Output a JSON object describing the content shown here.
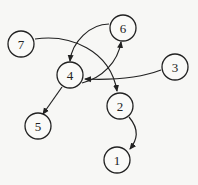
{
  "diagram": {
    "type": "directed-graph",
    "nodes": [
      {
        "id": "1",
        "label": "1",
        "x": 117,
        "y": 160
      },
      {
        "id": "2",
        "label": "2",
        "x": 120,
        "y": 106
      },
      {
        "id": "3",
        "label": "3",
        "x": 175,
        "y": 67
      },
      {
        "id": "4",
        "label": "4",
        "x": 70,
        "y": 75
      },
      {
        "id": "5",
        "label": "5",
        "x": 38,
        "y": 126
      },
      {
        "id": "6",
        "label": "6",
        "x": 123,
        "y": 28
      },
      {
        "id": "7",
        "label": "7",
        "x": 21,
        "y": 44
      }
    ],
    "edges": [
      {
        "from": "7",
        "to": "2"
      },
      {
        "from": "6",
        "to": "4"
      },
      {
        "from": "4",
        "to": "6"
      },
      {
        "from": "3",
        "to": "4"
      },
      {
        "from": "4",
        "to": "5"
      },
      {
        "from": "2",
        "to": "1"
      }
    ]
  }
}
